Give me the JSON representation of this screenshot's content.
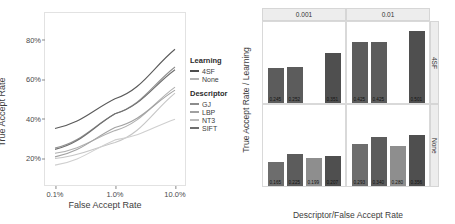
{
  "chart_data": [
    {
      "type": "line",
      "title": "",
      "xlabel": "False Accept Rate",
      "ylabel": "True Accept Rate",
      "x_scale": "log",
      "x_ticks": [
        "0.1%",
        "1.0%",
        "10.0%"
      ],
      "x_values": [
        0.001,
        0.01,
        0.1
      ],
      "y_ticks": [
        "20%",
        "40%",
        "60%",
        "80%"
      ],
      "y_values": [
        0.2,
        0.4,
        0.6,
        0.8
      ],
      "ylim": [
        0.1,
        0.9
      ],
      "grid": false,
      "legend_position": "right",
      "legends": [
        {
          "title": "Learning",
          "entries": [
            {
              "label": "4SF",
              "color": "#4d4d4d"
            },
            {
              "label": "None",
              "color": "#b4b4b4"
            }
          ]
        },
        {
          "title": "Descriptor",
          "entries": [
            {
              "label": "GJ",
              "color": "#8c8c8c"
            },
            {
              "label": "LBP",
              "color": "#a0a0a0"
            },
            {
              "label": "NT3",
              "color": "#bcbcbc"
            },
            {
              "label": "SIFT",
              "color": "#6e6e6e"
            }
          ]
        }
      ],
      "series": [
        {
          "name": "4SF / SIFT",
          "learning": "4SF",
          "descriptor": "SIFT",
          "color": "#5a5a5a",
          "points": [
            [
              0.001,
              0.351
            ],
            [
              0.01,
              0.501
            ],
            [
              0.1,
              0.752
            ]
          ]
        },
        {
          "name": "4SF / LBP",
          "learning": "4SF",
          "descriptor": "LBP",
          "color": "#909090",
          "points": [
            [
              0.001,
              0.252
            ],
            [
              0.01,
              0.425
            ],
            [
              0.1,
              0.662
            ]
          ]
        },
        {
          "name": "4SF / GJ",
          "learning": "4SF",
          "descriptor": "GJ",
          "color": "#6f6f6f",
          "points": [
            [
              0.001,
              0.245
            ],
            [
              0.01,
              0.425
            ],
            [
              0.1,
              0.648
            ]
          ]
        },
        {
          "name": "None / LBP",
          "learning": "None",
          "descriptor": "LBP",
          "color": "#b0b0b0",
          "points": [
            [
              0.001,
              0.225
            ],
            [
              0.01,
              0.34
            ],
            [
              0.1,
              0.56
            ]
          ]
        },
        {
          "name": "None / SIFT",
          "learning": "None",
          "descriptor": "SIFT",
          "color": "#a2a2a2",
          "points": [
            [
              0.001,
              0.207
            ],
            [
              0.01,
              0.356
            ],
            [
              0.1,
              0.545
            ]
          ]
        },
        {
          "name": "None / NT3",
          "learning": "None",
          "descriptor": "NT3",
          "color": "#c6c6c6",
          "points": [
            [
              0.001,
              0.199
            ],
            [
              0.01,
              0.28
            ],
            [
              0.1,
              0.53
            ]
          ]
        },
        {
          "name": "None / GJ",
          "learning": "None",
          "descriptor": "GJ",
          "color": "#cfcfcf",
          "points": [
            [
              0.001,
              0.165
            ],
            [
              0.01,
              0.293
            ],
            [
              0.1,
              0.398
            ]
          ]
        }
      ]
    },
    {
      "type": "bar",
      "title": "",
      "xlabel": "Descriptor/False Accept Rate",
      "ylabel": "True Accept Rate / Learning",
      "categories": [
        "GJ",
        "LBP",
        "NT3",
        "SIFT"
      ],
      "y_ticks": [
        "0.0",
        "0.1",
        "0.2",
        "0.3",
        "0.4",
        "0.5"
      ],
      "ylim": [
        0.0,
        0.56
      ],
      "grid": false,
      "col_strips": [
        "0.001",
        "0.01"
      ],
      "row_strips": [
        "4SF",
        "None"
      ],
      "panels": [
        {
          "row": "4SF",
          "col": "0.001",
          "bars": [
            {
              "category": "GJ",
              "value": 0.245,
              "label": "0.245",
              "color": "#5c5c5c"
            },
            {
              "category": "LBP",
              "value": 0.252,
              "label": "0.252",
              "color": "#5c5c5c"
            },
            {
              "category": "NT3",
              "value": 0.0,
              "label": "",
              "color": "#5c5c5c"
            },
            {
              "category": "SIFT",
              "value": 0.351,
              "label": "0.351",
              "color": "#4f4f4f"
            }
          ]
        },
        {
          "row": "4SF",
          "col": "0.01",
          "bars": [
            {
              "category": "GJ",
              "value": 0.425,
              "label": "0.425",
              "color": "#5c5c5c"
            },
            {
              "category": "LBP",
              "value": 0.425,
              "label": "0.425",
              "color": "#5c5c5c"
            },
            {
              "category": "NT3",
              "value": 0.0,
              "label": "",
              "color": "#5c5c5c"
            },
            {
              "category": "SIFT",
              "value": 0.501,
              "label": "0.501",
              "color": "#4f4f4f"
            }
          ]
        },
        {
          "row": "None",
          "col": "0.001",
          "bars": [
            {
              "category": "GJ",
              "value": 0.165,
              "label": "0.165",
              "color": "#6d6d6d"
            },
            {
              "category": "LBP",
              "value": 0.225,
              "label": "0.225",
              "color": "#5c5c5c"
            },
            {
              "category": "NT3",
              "value": 0.199,
              "label": "0.199",
              "color": "#8e8e8e"
            },
            {
              "category": "SIFT",
              "value": 0.207,
              "label": "0.207",
              "color": "#4f4f4f"
            }
          ]
        },
        {
          "row": "None",
          "col": "0.01",
          "bars": [
            {
              "category": "GJ",
              "value": 0.293,
              "label": "0.293",
              "color": "#6d6d6d"
            },
            {
              "category": "LBP",
              "value": 0.34,
              "label": "0.340",
              "color": "#5c5c5c"
            },
            {
              "category": "NT3",
              "value": 0.28,
              "label": "0.280",
              "color": "#8e8e8e"
            },
            {
              "category": "SIFT",
              "value": 0.356,
              "label": "0.356",
              "color": "#4f4f4f"
            }
          ]
        }
      ]
    }
  ]
}
